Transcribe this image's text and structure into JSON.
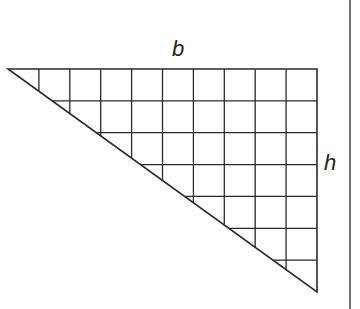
{
  "figure": {
    "labels": {
      "base": "b",
      "height": "h"
    },
    "grid": {
      "columns": 10,
      "rows": 7
    },
    "triangle": {
      "vertices": [
        [
          8,
          69
        ],
        [
          317,
          69
        ],
        [
          317,
          292
        ]
      ]
    },
    "colors": {
      "line": "#2a2a2a",
      "background": "#ffffff"
    }
  }
}
